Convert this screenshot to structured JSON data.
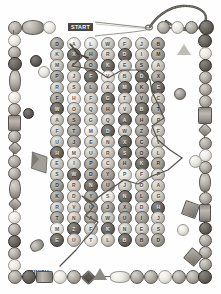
{
  "puzzle": {
    "title": "Beaded Maze Puzzle",
    "start_label": "START",
    "finish_label": "FINISH",
    "columns": 7,
    "rows": 22,
    "accent_color": "#4a4742",
    "path_color": "#55524d"
  },
  "grid": {
    "rows": [
      {
        "cells": [
          {
            "letter": "D",
            "tone": "tone-b"
          },
          {
            "letter": "A",
            "tone": "tone-d"
          },
          {
            "letter": "L",
            "tone": "tone-d"
          },
          {
            "letter": "W",
            "tone": "tone-a"
          },
          {
            "letter": "F",
            "tone": "tone-a"
          },
          {
            "letter": "J",
            "tone": "tone-a"
          },
          {
            "letter": "B",
            "tone": "tone-b"
          }
        ]
      },
      {
        "cells": [
          {
            "letter": "K",
            "tone": "tone-a"
          },
          {
            "letter": "X",
            "tone": "tone-c"
          },
          {
            "letter": "H",
            "tone": "tone-b"
          },
          {
            "letter": "R",
            "tone": "tone-a"
          },
          {
            "letter": "D",
            "tone": "tone-c"
          },
          {
            "letter": "I",
            "tone": "tone-a"
          },
          {
            "letter": "M",
            "tone": "tone-b"
          }
        ]
      },
      {
        "cells": [
          {
            "letter": "M",
            "tone": "tone-a"
          },
          {
            "letter": "C",
            "tone": "tone-b"
          },
          {
            "letter": "O",
            "tone": "tone-b"
          },
          {
            "letter": "K",
            "tone": "tone-c"
          },
          {
            "letter": "E",
            "tone": "tone-a"
          },
          {
            "letter": "S",
            "tone": "tone-b"
          },
          {
            "letter": "A",
            "tone": "tone-a"
          }
        ]
      },
      {
        "cells": [
          {
            "letter": "P",
            "tone": "tone-b"
          },
          {
            "letter": "J",
            "tone": "tone-a"
          },
          {
            "letter": "F",
            "tone": "tone-c"
          },
          {
            "letter": "V",
            "tone": "tone-d"
          },
          {
            "letter": "B",
            "tone": "tone-a"
          },
          {
            "letter": "D",
            "tone": "tone-c"
          },
          {
            "letter": "X",
            "tone": "tone-b"
          }
        ]
      },
      {
        "cells": [
          {
            "letter": "R",
            "tone": "tone-a"
          },
          {
            "letter": "S",
            "tone": "tone-a"
          },
          {
            "letter": "L",
            "tone": "tone-b"
          },
          {
            "letter": "X",
            "tone": "tone-a"
          },
          {
            "letter": "M",
            "tone": "tone-c"
          },
          {
            "letter": "K",
            "tone": "tone-b"
          },
          {
            "letter": "E",
            "tone": "tone-c"
          }
        ]
      },
      {
        "cells": [
          {
            "letter": "F",
            "tone": "tone-b"
          },
          {
            "letter": "H",
            "tone": "tone-d"
          },
          {
            "letter": "F",
            "tone": "tone-a"
          },
          {
            "letter": "G",
            "tone": "tone-c"
          },
          {
            "letter": "T",
            "tone": "tone-a"
          },
          {
            "letter": "V",
            "tone": "tone-b"
          },
          {
            "letter": "C",
            "tone": "tone-a"
          }
        ]
      },
      {
        "cells": [
          {
            "letter": "W",
            "tone": "tone-c"
          },
          {
            "letter": "O",
            "tone": "tone-a"
          },
          {
            "letter": "Q",
            "tone": "tone-a"
          },
          {
            "letter": "H",
            "tone": "tone-b"
          },
          {
            "letter": "V",
            "tone": "tone-a"
          },
          {
            "letter": "B",
            "tone": "tone-c"
          },
          {
            "letter": "T",
            "tone": "tone-b"
          }
        ]
      },
      {
        "cells": [
          {
            "letter": "A",
            "tone": "tone-a"
          },
          {
            "letter": "S",
            "tone": "tone-b"
          },
          {
            "letter": "G",
            "tone": "tone-a"
          },
          {
            "letter": "Q",
            "tone": "tone-a"
          },
          {
            "letter": "A",
            "tone": "tone-c"
          },
          {
            "letter": "H",
            "tone": "tone-b"
          },
          {
            "letter": "P",
            "tone": "tone-a"
          }
        ]
      },
      {
        "cells": [
          {
            "letter": "F",
            "tone": "tone-a"
          },
          {
            "letter": "T",
            "tone": "tone-b"
          },
          {
            "letter": "M",
            "tone": "tone-d"
          },
          {
            "letter": "D",
            "tone": "tone-c"
          },
          {
            "letter": "W",
            "tone": "tone-a"
          },
          {
            "letter": "Z",
            "tone": "tone-b"
          },
          {
            "letter": "F",
            "tone": "tone-a"
          }
        ]
      },
      {
        "cells": [
          {
            "letter": "U",
            "tone": "tone-a"
          },
          {
            "letter": "J",
            "tone": "tone-b"
          },
          {
            "letter": "E",
            "tone": "tone-a"
          },
          {
            "letter": "N",
            "tone": "tone-a"
          },
          {
            "letter": "X",
            "tone": "tone-c"
          },
          {
            "letter": "C",
            "tone": "tone-b"
          },
          {
            "letter": "V",
            "tone": "tone-a"
          }
        ]
      },
      {
        "cells": [
          {
            "letter": "H",
            "tone": "tone-c"
          },
          {
            "letter": "M",
            "tone": "tone-d"
          },
          {
            "letter": "U",
            "tone": "tone-a"
          },
          {
            "letter": "R",
            "tone": "tone-a"
          },
          {
            "letter": "S",
            "tone": "tone-c"
          },
          {
            "letter": "O",
            "tone": "tone-b"
          },
          {
            "letter": "L",
            "tone": "tone-a"
          }
        ]
      },
      {
        "cells": [
          {
            "letter": "E",
            "tone": "tone-a"
          },
          {
            "letter": "I",
            "tone": "tone-a"
          },
          {
            "letter": "P",
            "tone": "tone-b"
          },
          {
            "letter": "C",
            "tone": "tone-a"
          },
          {
            "letter": "H",
            "tone": "tone-b"
          },
          {
            "letter": "K",
            "tone": "tone-c"
          },
          {
            "letter": "R",
            "tone": "tone-b"
          }
        ]
      },
      {
        "cells": [
          {
            "letter": "S",
            "tone": "tone-a"
          },
          {
            "letter": "W",
            "tone": "tone-c"
          },
          {
            "letter": "D",
            "tone": "tone-b"
          },
          {
            "letter": "Y",
            "tone": "tone-b"
          },
          {
            "letter": "P",
            "tone": "tone-d"
          },
          {
            "letter": "F",
            "tone": "tone-a"
          },
          {
            "letter": "P",
            "tone": "tone-a"
          }
        ]
      },
      {
        "cells": [
          {
            "letter": "D",
            "tone": "tone-b"
          },
          {
            "letter": "R",
            "tone": "tone-a"
          },
          {
            "letter": "N",
            "tone": "tone-c"
          },
          {
            "letter": "U",
            "tone": "tone-b"
          },
          {
            "letter": "J",
            "tone": "tone-a"
          },
          {
            "letter": "O",
            "tone": "tone-a"
          },
          {
            "letter": "A",
            "tone": "tone-a"
          }
        ]
      },
      {
        "cells": [
          {
            "letter": "K",
            "tone": "tone-b"
          },
          {
            "letter": "D",
            "tone": "tone-a"
          },
          {
            "letter": "Y",
            "tone": "tone-b"
          },
          {
            "letter": "S",
            "tone": "tone-d"
          },
          {
            "letter": "N",
            "tone": "tone-c"
          },
          {
            "letter": "L",
            "tone": "tone-b"
          },
          {
            "letter": "G",
            "tone": "tone-a"
          }
        ]
      },
      {
        "cells": [
          {
            "letter": "R",
            "tone": "tone-a"
          },
          {
            "letter": "V",
            "tone": "tone-a"
          },
          {
            "letter": "U",
            "tone": "tone-b"
          },
          {
            "letter": "J",
            "tone": "tone-b"
          },
          {
            "letter": "X",
            "tone": "tone-b"
          },
          {
            "letter": "D",
            "tone": "tone-a"
          },
          {
            "letter": "H",
            "tone": "tone-c"
          }
        ]
      },
      {
        "cells": [
          {
            "letter": "T",
            "tone": "tone-b"
          },
          {
            "letter": "N",
            "tone": "tone-a"
          },
          {
            "letter": "A",
            "tone": "tone-b"
          },
          {
            "letter": "W",
            "tone": "tone-a"
          },
          {
            "letter": "U",
            "tone": "tone-b"
          },
          {
            "letter": "I",
            "tone": "tone-b"
          },
          {
            "letter": "J",
            "tone": "tone-a"
          }
        ]
      },
      {
        "cells": [
          {
            "letter": "M",
            "tone": "tone-d"
          },
          {
            "letter": "Z",
            "tone": "tone-c"
          },
          {
            "letter": "F",
            "tone": "tone-a"
          },
          {
            "letter": "K",
            "tone": "tone-c"
          },
          {
            "letter": "N",
            "tone": "tone-a"
          },
          {
            "letter": "E",
            "tone": "tone-a"
          },
          {
            "letter": "S",
            "tone": "tone-a"
          }
        ]
      },
      {
        "cells": [
          {
            "letter": "E",
            "tone": "tone-c"
          },
          {
            "letter": "U",
            "tone": "tone-a"
          },
          {
            "letter": "T",
            "tone": "tone-d"
          },
          {
            "letter": "L",
            "tone": "tone-a"
          },
          {
            "letter": "B",
            "tone": "tone-c"
          },
          {
            "letter": "B",
            "tone": "tone-b"
          },
          {
            "letter": "D",
            "tone": "tone-b"
          }
        ]
      }
    ]
  },
  "decorations": {
    "needle_thread": "needle-and-thread",
    "items": [
      {
        "name": "scatter-bead-round-dark"
      },
      {
        "name": "scatter-bead-round-light"
      },
      {
        "name": "scatter-bead-triangle"
      },
      {
        "name": "scatter-bead-cube"
      },
      {
        "name": "scatter-bead-oval"
      },
      {
        "name": "scatter-bead-bowtie"
      }
    ]
  }
}
